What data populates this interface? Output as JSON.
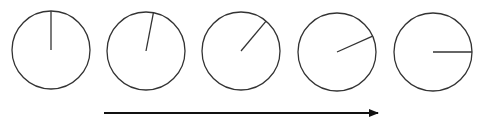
{
  "diagram": {
    "stroke_color": "#333333",
    "arrow_color": "#111111",
    "circles": [
      {
        "cx": 51,
        "cy": 50,
        "r": 39,
        "angle_deg": 0
      },
      {
        "cx": 146,
        "cy": 51,
        "r": 39,
        "angle_deg": 11
      },
      {
        "cx": 241,
        "cy": 51,
        "r": 39,
        "angle_deg": 40
      },
      {
        "cx": 337,
        "cy": 52,
        "r": 39,
        "angle_deg": 66
      },
      {
        "cx": 433,
        "cy": 52,
        "r": 39,
        "angle_deg": 90
      }
    ],
    "arrow": {
      "x1": 104,
      "y1": 113,
      "x2": 378,
      "y2": 113,
      "direction": "right"
    }
  }
}
